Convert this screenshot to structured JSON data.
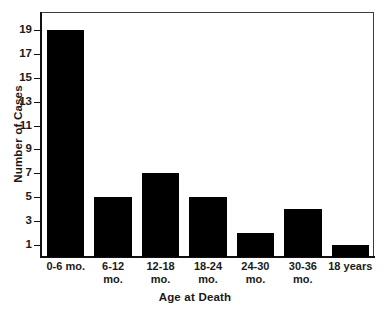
{
  "chart_data": {
    "type": "bar",
    "title": "",
    "xlabel": "Age at Death",
    "ylabel": "Number of Cases",
    "categories": [
      "0-6 mo.",
      "6-12 mo.",
      "12-18 mo.",
      "18-24 mo.",
      "24-30 mo.",
      "30-36 mo.",
      "18 years"
    ],
    "category_lines": [
      [
        "0-6 mo.",
        ""
      ],
      [
        "6-12",
        "mo."
      ],
      [
        "12-18",
        "mo."
      ],
      [
        "18-24",
        "mo."
      ],
      [
        "24-30",
        "mo."
      ],
      [
        "30-36",
        "mo."
      ],
      [
        "18 years",
        ""
      ]
    ],
    "values": [
      19,
      5,
      7,
      5,
      2,
      4,
      1
    ],
    "ylim": [
      0,
      20.5
    ],
    "yticks": [
      1,
      3,
      5,
      7,
      9,
      11,
      13,
      15,
      17,
      19
    ],
    "ytick_labels": [
      "1",
      "3",
      "5",
      "7",
      "9",
      "11",
      "13",
      "15",
      "17",
      "19"
    ],
    "grid": false,
    "legend": "none",
    "bar_color": "#000000",
    "axis_color": "#111111",
    "background_color": "#ffffff"
  }
}
